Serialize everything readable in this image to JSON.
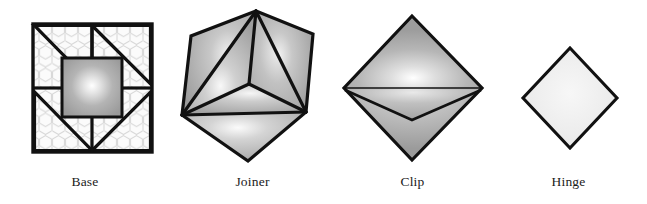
{
  "figure": {
    "width": 647,
    "height": 204,
    "background_color": "#ffffff",
    "stroke_color": "#111111",
    "caption_color": "#1b1b1b",
    "panels": [
      {
        "id": "base",
        "label": "Base",
        "shape": "square-frame-with-honeycomb-and-pinwheel-triangles",
        "fill_color": "#a8a8a8",
        "highlight_color": "#fdfdfd",
        "pattern": "honeycomb",
        "pattern_color": "#d8d8d8"
      },
      {
        "id": "joiner",
        "label": "Joiner",
        "shape": "hexagon-with-internal-y-edges",
        "fill_color": "#a6a6a6",
        "highlight_color": "#fbfbfb",
        "pattern": "none",
        "pattern_color": "#000000"
      },
      {
        "id": "clip",
        "label": "Clip",
        "shape": "diamond-with-folded-v-crease",
        "fill_color": "#a5a5a5",
        "highlight_color": "#fcfcfc",
        "pattern": "none",
        "pattern_color": "#000000"
      },
      {
        "id": "hinge",
        "label": "Hinge",
        "shape": "plain-diamond",
        "fill_color": "#ededed",
        "highlight_color": "#f6f6f6",
        "pattern": "none",
        "pattern_color": "#000000"
      }
    ]
  }
}
